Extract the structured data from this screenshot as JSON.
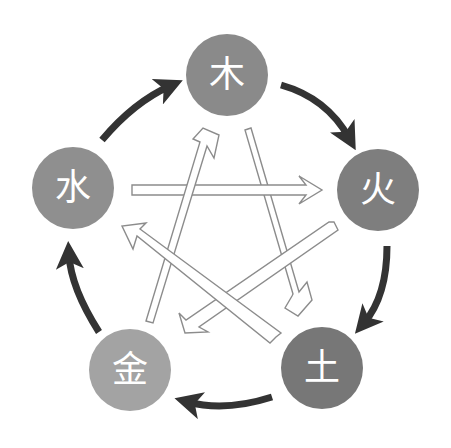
{
  "diagram": {
    "type": "five-elements-cycle",
    "nodes": [
      {
        "id": "wood",
        "glyph": "木",
        "meaning": "Wood",
        "cx": 227,
        "cy": 75,
        "color": "#8a8a8a"
      },
      {
        "id": "fire",
        "glyph": "火",
        "meaning": "Fire",
        "cx": 378,
        "cy": 190,
        "color": "#7e7e7e"
      },
      {
        "id": "earth",
        "glyph": "土",
        "meaning": "Earth",
        "cx": 322,
        "cy": 368,
        "color": "#777777"
      },
      {
        "id": "metal",
        "glyph": "金",
        "meaning": "Metal",
        "cx": 130,
        "cy": 370,
        "color": "#a3a3a3"
      },
      {
        "id": "water",
        "glyph": "水",
        "meaning": "Water",
        "cx": 73,
        "cy": 188,
        "color": "#8f8f8f"
      }
    ],
    "generating_cycle": {
      "style": "curved-dark-arrow",
      "color": "#333333",
      "edges": [
        {
          "from": "wood",
          "to": "fire"
        },
        {
          "from": "fire",
          "to": "earth"
        },
        {
          "from": "earth",
          "to": "metal"
        },
        {
          "from": "metal",
          "to": "water"
        },
        {
          "from": "water",
          "to": "wood"
        }
      ]
    },
    "overcoming_cycle": {
      "style": "outlined-straight-arrow",
      "outline_color": "#8c8c8c",
      "fill_color": "#ffffff",
      "edges": [
        {
          "from": "wood",
          "to": "earth"
        },
        {
          "from": "earth",
          "to": "water"
        },
        {
          "from": "water",
          "to": "fire"
        },
        {
          "from": "fire",
          "to": "metal"
        },
        {
          "from": "metal",
          "to": "wood"
        }
      ]
    }
  }
}
